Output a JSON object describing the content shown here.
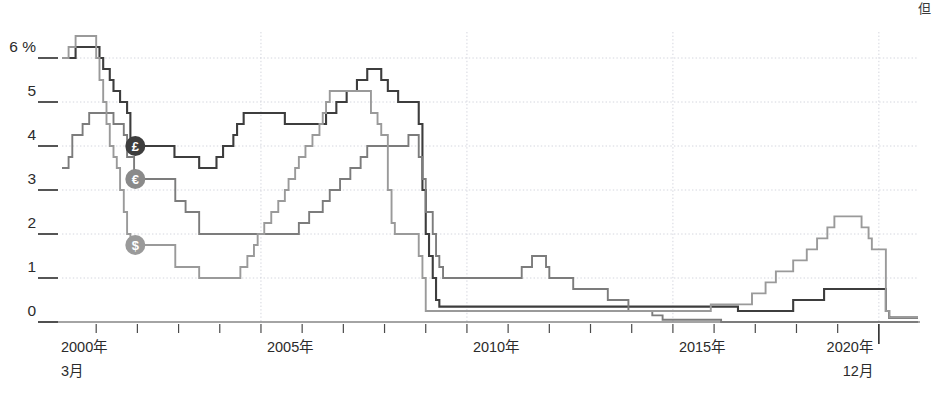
{
  "corner_note": "但",
  "chart_data": {
    "type": "line",
    "title": "",
    "subtitle": "",
    "xlabel": "",
    "ylabel": "",
    "ylim": [
      0,
      6.5
    ],
    "yticks": [
      0,
      1,
      2,
      3,
      4,
      5,
      6
    ],
    "ytick_labels": [
      "0",
      "1",
      "2",
      "3",
      "4",
      "5",
      "6 %"
    ],
    "grid": true,
    "legend_position": "inline-markers",
    "xlim_labels": {
      "start": "2000年",
      "start_sub": "3月",
      "end": "2020年",
      "end_sub": "12月"
    },
    "xticks": [
      2000,
      2001,
      2002,
      2003,
      2004,
      2005,
      2006,
      2007,
      2008,
      2009,
      2010,
      2011,
      2012,
      2013,
      2014,
      2015,
      2016,
      2017,
      2018,
      2019,
      2020
    ],
    "xtick_labels": [
      "2000年",
      "",
      "",
      "",
      "",
      "2005年",
      "",
      "",
      "",
      "",
      "2010年",
      "",
      "",
      "",
      "",
      "2015年",
      "",
      "",
      "",
      "",
      "2020年"
    ],
    "x_start": 2000.17,
    "x_end": 2020.95,
    "series": [
      {
        "name": "pound-sterling",
        "label": "£",
        "marker": "£",
        "color": "#3d3d3d",
        "width": 2.1,
        "marker_color": "#3d3d3d",
        "marker_x": 2001.95,
        "marker_y": 4.0,
        "points": [
          [
            2000.17,
            6.0
          ],
          [
            2000.5,
            6.25
          ],
          [
            2001.08,
            6.0
          ],
          [
            2001.17,
            5.75
          ],
          [
            2001.33,
            5.5
          ],
          [
            2001.42,
            5.25
          ],
          [
            2001.58,
            5.0
          ],
          [
            2001.75,
            4.75
          ],
          [
            2001.83,
            4.0
          ],
          [
            2002.9,
            3.75
          ],
          [
            2003.5,
            3.5
          ],
          [
            2003.92,
            3.75
          ],
          [
            2004.08,
            4.0
          ],
          [
            2004.33,
            4.25
          ],
          [
            2004.42,
            4.5
          ],
          [
            2004.58,
            4.75
          ],
          [
            2005.58,
            4.5
          ],
          [
            2006.58,
            4.75
          ],
          [
            2006.83,
            5.0
          ],
          [
            2007.08,
            5.25
          ],
          [
            2007.33,
            5.5
          ],
          [
            2007.58,
            5.75
          ],
          [
            2007.92,
            5.5
          ],
          [
            2008.08,
            5.25
          ],
          [
            2008.33,
            5.0
          ],
          [
            2008.83,
            4.5
          ],
          [
            2008.92,
            3.0
          ],
          [
            2009.0,
            2.0
          ],
          [
            2009.08,
            1.5
          ],
          [
            2009.17,
            1.0
          ],
          [
            2009.25,
            0.5
          ],
          [
            2009.33,
            0.35
          ],
          [
            2016.58,
            0.25
          ],
          [
            2017.92,
            0.5
          ],
          [
            2018.67,
            0.75
          ],
          [
            2020.17,
            0.25
          ],
          [
            2020.25,
            0.1
          ],
          [
            2020.95,
            0.1
          ]
        ]
      },
      {
        "name": "euro",
        "label": "€",
        "marker": "€",
        "color": "#7c7c7c",
        "width": 1.9,
        "marker_color": "#8a8a8a",
        "marker_x": 2001.95,
        "marker_y": 3.25,
        "points": [
          [
            2000.17,
            3.5
          ],
          [
            2000.33,
            3.75
          ],
          [
            2000.42,
            4.25
          ],
          [
            2000.67,
            4.5
          ],
          [
            2000.83,
            4.75
          ],
          [
            2001.42,
            4.5
          ],
          [
            2001.67,
            4.25
          ],
          [
            2001.75,
            3.75
          ],
          [
            2001.92,
            3.25
          ],
          [
            2002.92,
            2.75
          ],
          [
            2003.17,
            2.5
          ],
          [
            2003.5,
            2.0
          ],
          [
            2005.92,
            2.25
          ],
          [
            2006.17,
            2.5
          ],
          [
            2006.5,
            2.75
          ],
          [
            2006.67,
            3.0
          ],
          [
            2006.92,
            3.25
          ],
          [
            2007.17,
            3.5
          ],
          [
            2007.42,
            3.75
          ],
          [
            2007.58,
            4.0
          ],
          [
            2008.58,
            4.25
          ],
          [
            2008.83,
            3.75
          ],
          [
            2008.92,
            3.25
          ],
          [
            2009.0,
            2.5
          ],
          [
            2009.17,
            2.0
          ],
          [
            2009.25,
            1.5
          ],
          [
            2009.33,
            1.25
          ],
          [
            2009.42,
            1.0
          ],
          [
            2011.33,
            1.25
          ],
          [
            2011.58,
            1.5
          ],
          [
            2011.92,
            1.25
          ],
          [
            2012.0,
            1.0
          ],
          [
            2012.58,
            0.75
          ],
          [
            2013.42,
            0.5
          ],
          [
            2013.92,
            0.25
          ],
          [
            2014.5,
            0.15
          ],
          [
            2014.75,
            0.05
          ],
          [
            2016.17,
            0.0
          ],
          [
            2020.95,
            0.0
          ]
        ]
      },
      {
        "name": "us-dollar",
        "label": "$",
        "marker": "$",
        "color": "#9a9a9a",
        "width": 1.9,
        "marker_color": "#9a9a9a",
        "marker_x": 2001.95,
        "marker_y": 1.75,
        "points": [
          [
            2000.17,
            6.0
          ],
          [
            2000.33,
            6.25
          ],
          [
            2000.5,
            6.5
          ],
          [
            2001.0,
            6.0
          ],
          [
            2001.08,
            5.5
          ],
          [
            2001.17,
            5.0
          ],
          [
            2001.25,
            4.5
          ],
          [
            2001.33,
            4.0
          ],
          [
            2001.42,
            3.75
          ],
          [
            2001.5,
            3.5
          ],
          [
            2001.58,
            3.0
          ],
          [
            2001.67,
            2.5
          ],
          [
            2001.75,
            2.0
          ],
          [
            2001.83,
            1.75
          ],
          [
            2002.0,
            1.75
          ],
          [
            2002.92,
            1.25
          ],
          [
            2003.5,
            1.0
          ],
          [
            2004.5,
            1.25
          ],
          [
            2004.67,
            1.5
          ],
          [
            2004.83,
            1.75
          ],
          [
            2004.92,
            2.0
          ],
          [
            2005.08,
            2.25
          ],
          [
            2005.25,
            2.5
          ],
          [
            2005.42,
            2.75
          ],
          [
            2005.58,
            3.0
          ],
          [
            2005.67,
            3.25
          ],
          [
            2005.83,
            3.5
          ],
          [
            2005.92,
            3.75
          ],
          [
            2006.08,
            4.0
          ],
          [
            2006.25,
            4.25
          ],
          [
            2006.42,
            4.5
          ],
          [
            2006.5,
            4.75
          ],
          [
            2006.58,
            5.0
          ],
          [
            2006.67,
            5.25
          ],
          [
            2007.67,
            4.75
          ],
          [
            2007.83,
            4.5
          ],
          [
            2007.92,
            4.25
          ],
          [
            2008.08,
            3.0
          ],
          [
            2008.17,
            2.25
          ],
          [
            2008.25,
            2.0
          ],
          [
            2008.83,
            1.5
          ],
          [
            2008.92,
            1.0
          ],
          [
            2009.0,
            0.25
          ],
          [
            2015.92,
            0.4
          ],
          [
            2016.92,
            0.65
          ],
          [
            2017.25,
            0.9
          ],
          [
            2017.5,
            1.15
          ],
          [
            2017.92,
            1.4
          ],
          [
            2018.25,
            1.65
          ],
          [
            2018.5,
            1.9
          ],
          [
            2018.75,
            2.15
          ],
          [
            2018.92,
            2.4
          ],
          [
            2019.58,
            2.15
          ],
          [
            2019.75,
            1.9
          ],
          [
            2019.83,
            1.65
          ],
          [
            2020.17,
            0.25
          ],
          [
            2020.25,
            0.1
          ],
          [
            2020.95,
            0.1
          ]
        ]
      }
    ]
  }
}
